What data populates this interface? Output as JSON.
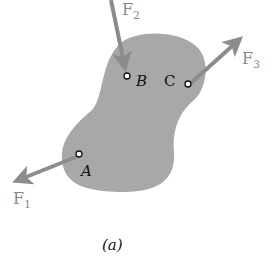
{
  "figure": {
    "caption": "(a)",
    "caption_italic_letter": "a",
    "body_color": "#a8a8a8",
    "arrow_color": "#8c8c8c",
    "points": [
      {
        "id": "A",
        "label": "A"
      },
      {
        "id": "B",
        "label": "B"
      },
      {
        "id": "C",
        "label": "C"
      }
    ],
    "forces": [
      {
        "id": "F1",
        "base": "F",
        "sub": "1",
        "applied_at": "A"
      },
      {
        "id": "F2",
        "base": "F",
        "sub": "2",
        "applied_at": "B"
      },
      {
        "id": "F3",
        "base": "F",
        "sub": "3",
        "applied_at": "C"
      }
    ]
  }
}
